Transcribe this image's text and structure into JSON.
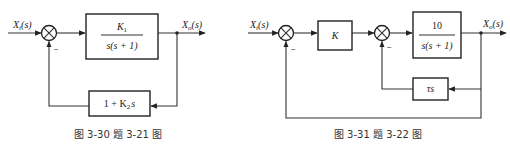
{
  "figure_left": {
    "caption": "图 3-30   题 3-21 图",
    "input_label": "X",
    "input_sub": "i",
    "input_arg": "(s)",
    "output_label": "X",
    "output_sub": "o",
    "output_arg": "(s)",
    "forward_block": {
      "numerator": "K",
      "numerator_sub": "1",
      "denominator": "s(s + 1)"
    },
    "feedback_block": {
      "text_pre": "1 + K",
      "text_sub": "2",
      "text_post": "s"
    },
    "feedback_sign": "−"
  },
  "figure_right": {
    "caption": "图 3-31  题 3-22 图",
    "input_label": "X",
    "input_sub": "i",
    "input_arg": "(s)",
    "output_label": "X",
    "output_sub": "o",
    "output_arg": "(s)",
    "gain_block": {
      "text": "K"
    },
    "plant_block": {
      "numerator": "10",
      "denominator": "s(s + 1)"
    },
    "inner_feedback_block": {
      "text": "τs"
    },
    "outer_feedback_sign": "−",
    "inner_feedback_sign": "−"
  }
}
